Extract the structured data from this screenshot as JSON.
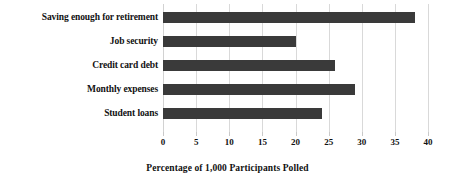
{
  "chart_data": {
    "type": "bar",
    "orientation": "horizontal",
    "title": "",
    "xlabel": "Percentage of 1,000 Participants Polled",
    "ylabel": "",
    "categories": [
      "Saving enough for retirement",
      "Job security",
      "Credit card debt",
      "Monthly expenses",
      "Student loans"
    ],
    "values": [
      38,
      20,
      26,
      29,
      24
    ],
    "xlim": [
      0,
      40
    ],
    "xticks": [
      0,
      5,
      10,
      15,
      20,
      25,
      30,
      35,
      40
    ],
    "xtick_labels": [
      "0",
      "5",
      "10",
      "15",
      "20",
      "25",
      "30",
      "35",
      "40"
    ],
    "grid": "vertical",
    "legend": "none",
    "bar_color": "#3a3a3a",
    "gridline_color": "#d9d9d9",
    "background_color": "#ffffff"
  }
}
